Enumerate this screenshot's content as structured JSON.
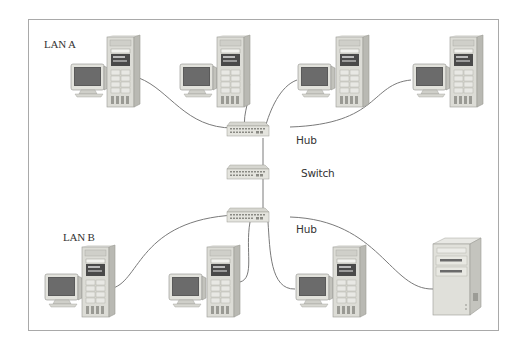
{
  "diagram": {
    "type": "network-topology",
    "frame_color": "#a9a9a9",
    "cable_color": "#7a7a7a",
    "labels": {
      "lan_a": "LAN A",
      "lan_b": "LAN B",
      "hub_top": "Hub",
      "switch": "Switch",
      "hub_bottom": "Hub"
    },
    "nodes": [
      {
        "id": "pc-a1",
        "kind": "workstation",
        "group": "LAN A"
      },
      {
        "id": "pc-a2",
        "kind": "workstation",
        "group": "LAN A"
      },
      {
        "id": "pc-a3",
        "kind": "workstation",
        "group": "LAN A"
      },
      {
        "id": "pc-a4",
        "kind": "workstation",
        "group": "LAN A"
      },
      {
        "id": "hub-a",
        "kind": "hub",
        "label": "Hub"
      },
      {
        "id": "switch",
        "kind": "switch",
        "label": "Switch"
      },
      {
        "id": "hub-b",
        "kind": "hub",
        "label": "Hub"
      },
      {
        "id": "pc-b1",
        "kind": "workstation",
        "group": "LAN B"
      },
      {
        "id": "pc-b2",
        "kind": "workstation",
        "group": "LAN B"
      },
      {
        "id": "pc-b3",
        "kind": "workstation",
        "group": "LAN B"
      },
      {
        "id": "server-b",
        "kind": "server",
        "group": "LAN B"
      }
    ],
    "edges": [
      [
        "pc-a1",
        "hub-a"
      ],
      [
        "pc-a2",
        "hub-a"
      ],
      [
        "pc-a3",
        "hub-a"
      ],
      [
        "pc-a4",
        "hub-a"
      ],
      [
        "hub-a",
        "switch"
      ],
      [
        "switch",
        "hub-b"
      ],
      [
        "pc-b1",
        "hub-b"
      ],
      [
        "pc-b2",
        "hub-b"
      ],
      [
        "pc-b3",
        "hub-b"
      ],
      [
        "server-b",
        "hub-b"
      ]
    ]
  }
}
